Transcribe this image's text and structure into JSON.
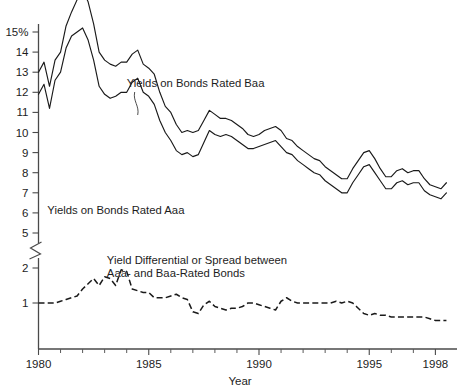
{
  "chart_data": {
    "type": "line",
    "title": "",
    "xlabel": "Year",
    "ylabel": "",
    "grid": false,
    "legend_position": "inline-annotations",
    "xlim": [
      1980,
      1998.75
    ],
    "ylim_upper": [
      5,
      15
    ],
    "ylim_lower": [
      0,
      2.5
    ],
    "y_axis_break": true,
    "y_axis_break_note": "Axis broken between 5 and 2; upper panel shows yields in percent, lower panel shows spread in percentage points",
    "y_tick_labels_upper": [
      "15%",
      "14",
      "13",
      "12",
      "11",
      "10",
      "9",
      "8",
      "7",
      "6",
      "5"
    ],
    "y_tick_values_upper": [
      15,
      14,
      13,
      12,
      11,
      10,
      9,
      8,
      7,
      6,
      5
    ],
    "y_tick_labels_lower": [
      "2",
      "1"
    ],
    "y_tick_values_lower": [
      2,
      1
    ],
    "x_tick_labels": [
      "1980",
      "1985",
      "1990",
      "1995",
      "1998"
    ],
    "x_tick_values": [
      1980,
      1985,
      1990,
      1995,
      1998
    ],
    "x_minor_ticks": [
      1981,
      1982,
      1983,
      1984,
      1986,
      1987,
      1988,
      1989,
      1991,
      1992,
      1993,
      1994,
      1996,
      1997
    ],
    "annotations": [
      {
        "id": "baa-label",
        "text": "Yields on Bonds Rated Baa",
        "x": 1984.0,
        "y_px": 87,
        "leader": true
      },
      {
        "id": "aaa-label",
        "text": "Yields on Bonds Rated Aaa",
        "x": 1980.4,
        "y_px": 214,
        "leader": false
      },
      {
        "id": "spread-label-line1",
        "text": "Yield Differential or Spread between",
        "x": 1983.1,
        "y_px": 264,
        "leader": false
      },
      {
        "id": "spread-label-line2",
        "text": "Aaa- and Baa-Rated Bonds",
        "x": 1983.1,
        "y_px": 277,
        "leader": false
      }
    ],
    "x": [
      1980.0,
      1980.25,
      1980.5,
      1980.75,
      1981.0,
      1981.25,
      1981.5,
      1981.75,
      1982.0,
      1982.25,
      1982.5,
      1982.75,
      1983.0,
      1983.25,
      1983.5,
      1983.75,
      1984.0,
      1984.25,
      1984.5,
      1984.75,
      1985.0,
      1985.25,
      1985.5,
      1985.75,
      1986.0,
      1986.25,
      1986.5,
      1986.75,
      1987.0,
      1987.25,
      1987.5,
      1987.75,
      1988.0,
      1988.25,
      1988.5,
      1988.75,
      1989.0,
      1989.25,
      1989.5,
      1989.75,
      1990.0,
      1990.25,
      1990.5,
      1990.75,
      1991.0,
      1991.25,
      1991.5,
      1991.75,
      1992.0,
      1992.25,
      1992.5,
      1992.75,
      1993.0,
      1993.25,
      1993.5,
      1993.75,
      1994.0,
      1994.25,
      1994.5,
      1994.75,
      1995.0,
      1995.25,
      1995.5,
      1995.75,
      1996.0,
      1996.25,
      1996.5,
      1996.75,
      1997.0,
      1997.25,
      1997.5,
      1997.75,
      1998.0,
      1998.25,
      1998.5
    ],
    "series": [
      {
        "name": "Yields on Bonds Rated Baa",
        "style": "solid",
        "units": "percent",
        "panel": "upper",
        "values": [
          13.0,
          13.5,
          12.3,
          13.6,
          14.0,
          15.3,
          16.0,
          16.6,
          17.1,
          16.5,
          15.4,
          14.0,
          13.6,
          13.4,
          13.3,
          13.5,
          13.5,
          13.9,
          14.1,
          13.4,
          13.2,
          12.9,
          12.0,
          11.3,
          11.0,
          10.4,
          10.0,
          10.1,
          10.0,
          10.1,
          10.6,
          11.1,
          10.9,
          10.7,
          10.7,
          10.6,
          10.4,
          10.2,
          9.9,
          9.8,
          9.9,
          10.1,
          10.2,
          10.3,
          10.1,
          9.7,
          9.6,
          9.3,
          9.1,
          8.9,
          8.7,
          8.6,
          8.3,
          8.1,
          7.9,
          7.7,
          7.7,
          8.2,
          8.6,
          9.0,
          9.1,
          8.7,
          8.2,
          7.8,
          7.8,
          8.1,
          8.2,
          8.0,
          8.1,
          8.1,
          7.7,
          7.4,
          7.3,
          7.2,
          7.5
        ]
      },
      {
        "name": "Yields on Bonds Rated Aaa",
        "style": "solid",
        "units": "percent",
        "panel": "upper",
        "values": [
          11.9,
          12.4,
          11.2,
          12.6,
          13.0,
          14.2,
          14.8,
          15.0,
          15.2,
          14.6,
          13.6,
          12.3,
          11.9,
          11.7,
          11.8,
          12.0,
          12.0,
          12.5,
          12.7,
          12.0,
          11.8,
          11.4,
          10.6,
          10.0,
          9.6,
          9.1,
          8.9,
          9.0,
          8.8,
          8.9,
          9.5,
          10.1,
          9.9,
          9.8,
          9.9,
          9.8,
          9.6,
          9.4,
          9.2,
          9.2,
          9.3,
          9.4,
          9.5,
          9.6,
          9.3,
          9.0,
          8.9,
          8.6,
          8.4,
          8.2,
          8.0,
          7.9,
          7.6,
          7.4,
          7.2,
          7.0,
          7.0,
          7.5,
          7.9,
          8.3,
          8.4,
          8.0,
          7.6,
          7.2,
          7.2,
          7.5,
          7.6,
          7.4,
          7.5,
          7.5,
          7.1,
          6.9,
          6.8,
          6.7,
          7.0
        ]
      },
      {
        "name": "Yield Differential or Spread between Aaa- and Baa-Rated Bonds",
        "style": "dashed",
        "units": "percentage points",
        "panel": "lower",
        "values": [
          1.0,
          1.0,
          1.0,
          1.0,
          1.05,
          1.1,
          1.15,
          1.2,
          1.4,
          1.55,
          1.7,
          1.5,
          1.75,
          1.7,
          1.5,
          1.95,
          1.9,
          1.4,
          1.35,
          1.3,
          1.3,
          1.15,
          1.15,
          1.15,
          1.2,
          1.25,
          1.15,
          1.1,
          0.75,
          0.7,
          0.95,
          1.05,
          0.9,
          0.85,
          0.8,
          0.85,
          0.85,
          0.9,
          1.0,
          1.0,
          0.95,
          0.9,
          0.85,
          0.8,
          1.05,
          1.15,
          1.05,
          1.0,
          1.0,
          1.0,
          1.0,
          1.0,
          1.0,
          1.0,
          1.05,
          1.0,
          1.05,
          1.0,
          0.85,
          0.7,
          0.65,
          0.7,
          0.65,
          0.65,
          0.6,
          0.6,
          0.6,
          0.6,
          0.6,
          0.6,
          0.6,
          0.55,
          0.5,
          0.5,
          0.5
        ]
      }
    ]
  }
}
